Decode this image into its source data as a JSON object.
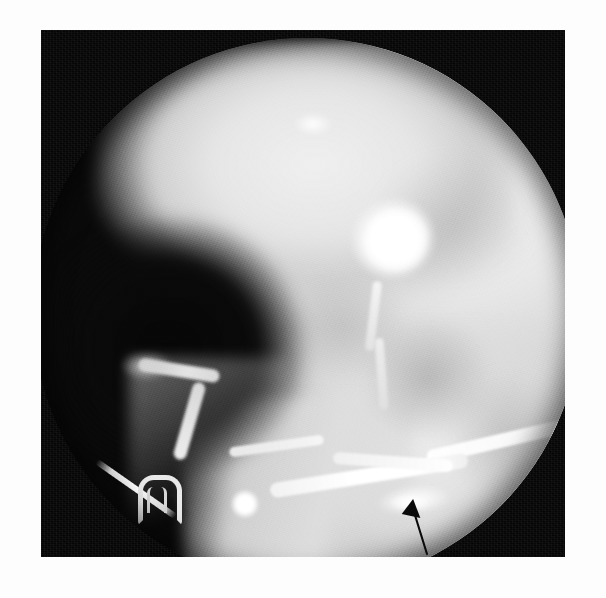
{
  "figure": {
    "modality": "fluoroscopic radiograph",
    "study": "retrograde urethrogram",
    "view": "oblique pelvis",
    "caption": "",
    "caption_visible": false
  },
  "image_frame": {
    "background_color": "#fdfdfd",
    "film_color": "#050505",
    "field_shape": "circular-collimation",
    "x": 41,
    "y": 30,
    "width": 524,
    "height": 527
  },
  "palette": {
    "page_white": "#fdfdfd",
    "film_black": "#050505",
    "contrast_white": "#ffffff",
    "soft_tissue_gray": "#d8d8d8",
    "bone_gray": "#ececec",
    "annotation_black": "#0b0b0b"
  },
  "findings": [
    {
      "id": "bladder-contrast",
      "label": "contrast-opacified bladder base",
      "appearance": "dense white ovoid opacity",
      "position": "upper right of field"
    },
    {
      "id": "urethra",
      "label": "contrast-filled urethra",
      "appearance": "continuous bright tubular column",
      "position": "curving from bladder base inferolaterally to the penile shaft"
    },
    {
      "id": "extravasation",
      "label": "contrast extravasation",
      "appearance": "irregular extraluminal contrast collection",
      "position": "inferior to the bulbar urethra, indicated by the arrow"
    },
    {
      "id": "radiopaque-sliver",
      "label": "thin linear radiopaque density",
      "appearance": "elongated needle-like opacity",
      "position": "lower left, outside the body"
    },
    {
      "id": "radiopaque-clip",
      "label": "horseshoe-shaped metallic clip",
      "appearance": "U-shaped radiopaque marker",
      "position": "lower left, outside the body"
    }
  ],
  "annotation": {
    "type": "arrow",
    "color": "#0b0b0b",
    "points_to": "contrast extravasation",
    "tip": {
      "x": 381,
      "y": 476
    },
    "tail": {
      "x": 397,
      "y": 524
    },
    "direction": "up-left"
  }
}
